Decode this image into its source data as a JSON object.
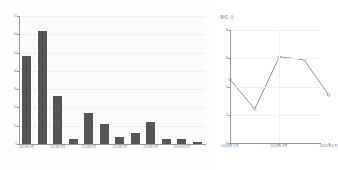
{
  "chart_data": [
    {
      "id": "bar",
      "type": "bar",
      "title": "",
      "xlabel": "",
      "ylabel": "",
      "grid": true,
      "legend": null,
      "bar_color": "#555555",
      "plot_background": "#fbfbfb",
      "ylim": [
        0,
        70
      ],
      "yticks": [
        0,
        10,
        20,
        30,
        40,
        50,
        60,
        70
      ],
      "ytick_labels": [
        "0",
        "10",
        "20",
        "30",
        "40",
        "50",
        "60",
        "70"
      ],
      "categories": [
        "2018年1月",
        "2018年2月",
        "2018年3月",
        "2018年4月",
        "2018年5月",
        "2018年6月",
        "2018年7月",
        "2018年8月",
        "2018年9月",
        "2018年10月",
        "2018年11月",
        "2018年12月"
      ],
      "visible_xtick_labels": [
        {
          "index": 0,
          "label": "2018年1月"
        },
        {
          "index": 2,
          "label": "2018年3月"
        },
        {
          "index": 4,
          "label": "2018年5月"
        },
        {
          "index": 6,
          "label": "2018年7月"
        },
        {
          "index": 8,
          "label": "2018年9月"
        },
        {
          "index": 10,
          "label": "2018年11月"
        }
      ],
      "values": [
        48,
        62,
        26,
        3,
        17,
        11,
        4,
        6,
        12,
        3,
        3,
        1
      ]
    },
    {
      "id": "line",
      "type": "line",
      "title": "",
      "unit_label": "单位: 元",
      "xlabel": "",
      "ylabel": "",
      "grid": true,
      "legend": null,
      "line_color": "#777777",
      "marker": "diamond",
      "ylim": [
        0,
        8
      ],
      "yticks": [
        0,
        2,
        4,
        6,
        8
      ],
      "ytick_labels": [
        "0",
        "2",
        "4",
        "6",
        "8"
      ],
      "x": [
        "2018年1月",
        "2018年2月",
        "2018年3月",
        "2018年4月",
        "2018年5月"
      ],
      "visible_xtick_labels": [
        {
          "index": 0,
          "label": "2018年1月"
        },
        {
          "index": 2,
          "label": "2018年3月"
        },
        {
          "index": 4,
          "label": "2018年5月"
        }
      ],
      "values": [
        4.5,
        2.4,
        6.1,
        5.9,
        3.4
      ]
    }
  ]
}
